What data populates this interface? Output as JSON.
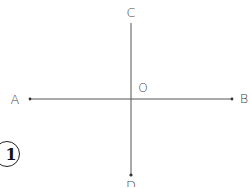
{
  "figure": {
    "number": "1"
  },
  "points": {
    "A": {
      "label": "A",
      "x": 30,
      "y": 99
    },
    "B": {
      "label": "B",
      "x": 232,
      "y": 99
    },
    "C": {
      "label": "C",
      "x": 131,
      "y": 23
    },
    "D": {
      "label": "D",
      "x": 131,
      "y": 175
    },
    "O": {
      "label": "O",
      "x": 131,
      "y": 99
    }
  },
  "lines": [
    {
      "name": "AB",
      "from": "A",
      "to": "B",
      "orientation": "horizontal"
    },
    {
      "name": "CD",
      "from": "C",
      "to": "D",
      "orientation": "vertical"
    }
  ],
  "colors": {
    "line": "#555555",
    "text": "#444444",
    "background": "#ffffff"
  }
}
